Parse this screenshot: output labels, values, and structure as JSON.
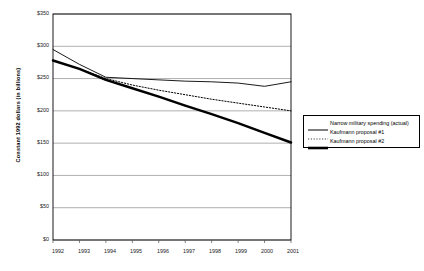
{
  "chart_data": {
    "type": "line",
    "title": "",
    "xlabel": "",
    "ylabel": "Constant 1992 dollars (in billions)",
    "categories": [
      "1992",
      "1993",
      "1994",
      "1995",
      "1996",
      "1997",
      "1998",
      "1999",
      "2000",
      "2001"
    ],
    "x": [
      1992,
      1993,
      1994,
      1995,
      1996,
      1997,
      1998,
      1999,
      2000,
      2001
    ],
    "ylim": [
      0,
      350
    ],
    "ytick_labels": [
      "$0",
      "$50",
      "$100",
      "$150",
      "$200",
      "$250",
      "$300",
      "$350"
    ],
    "ytick_values": [
      0,
      50,
      100,
      150,
      200,
      250,
      300,
      350
    ],
    "grid": true,
    "legend_position": "right-outside",
    "series": [
      {
        "name": "Narrow military spending (actual)",
        "style": "solid-thin",
        "color": "#000000",
        "values": [
          295,
          272,
          252,
          250,
          248,
          246,
          245,
          243,
          238,
          245
        ]
      },
      {
        "name": "Kaufmann proposal #1",
        "style": "dotted",
        "color": "#000000",
        "values": [
          278,
          265,
          250,
          240,
          232,
          225,
          218,
          212,
          206,
          200
        ]
      },
      {
        "name": "Kaufmann proposal #2",
        "style": "solid-thick",
        "color": "#000000",
        "values": [
          278,
          265,
          248,
          235,
          222,
          208,
          195,
          181,
          166,
          151
        ]
      }
    ]
  },
  "legend": {
    "entries": [
      "Narrow military spending (actual)",
      "Kaufmann proposal #1",
      "Kaufmann proposal #2"
    ]
  }
}
